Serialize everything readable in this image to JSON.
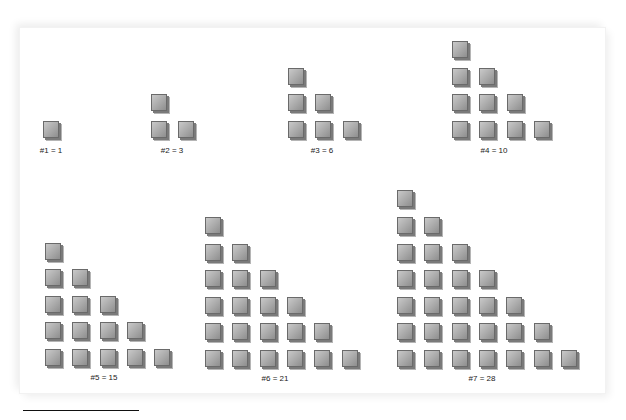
{
  "figure": {
    "groups": [
      {
        "n": 1,
        "value": 1,
        "label": "#1 = 1",
        "origin": [
          43,
          121
        ],
        "label_pos": [
          51,
          146
        ]
      },
      {
        "n": 2,
        "value": 3,
        "label": "#2 = 3",
        "origin": [
          151,
          121
        ],
        "label_pos": [
          172,
          146
        ]
      },
      {
        "n": 3,
        "value": 6,
        "label": "#3 = 6",
        "origin": [
          288,
          121
        ],
        "label_pos": [
          322,
          146
        ]
      },
      {
        "n": 4,
        "value": 10,
        "label": "#4 = 10",
        "origin": [
          452,
          121
        ],
        "label_pos": [
          494,
          146
        ]
      },
      {
        "n": 5,
        "value": 15,
        "label": "#5 = 15",
        "origin": [
          45,
          349
        ],
        "label_pos": [
          104,
          373
        ]
      },
      {
        "n": 6,
        "value": 21,
        "label": "#6 = 21",
        "origin": [
          205,
          350
        ],
        "label_pos": [
          275,
          374
        ]
      },
      {
        "n": 7,
        "value": 28,
        "label": "#7 = 28",
        "origin": [
          397,
          350
        ],
        "label_pos": [
          482,
          374
        ]
      }
    ],
    "spacing": {
      "dx": 27.3,
      "dy": 26.6
    },
    "colors": {
      "cube_face": "#b5b5b5",
      "cube_edge": "#6a6a6a",
      "text": "#222222",
      "rule": "#111111"
    }
  }
}
